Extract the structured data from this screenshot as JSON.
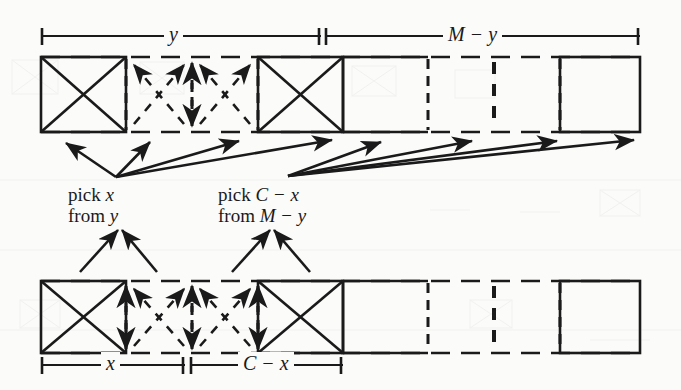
{
  "figure": {
    "background_color": "#fbfbfa",
    "ink_color": "#1a1a1a",
    "width": 681,
    "height": 390
  },
  "top_row": {
    "name": "upper-tape",
    "dimensions": [
      {
        "id": "y",
        "label": "y",
        "x_start": 41,
        "x_end": 321,
        "label_x": 172,
        "label_y": 26
      },
      {
        "id": "M-y",
        "label": "M − y",
        "x_start": 324,
        "x_end": 640,
        "label_x": 462,
        "label_y": 26
      }
    ],
    "cells": [
      {
        "index": 0,
        "style": "solid",
        "mark": "cross-full",
        "x": 41,
        "w": 85
      },
      {
        "index": 1,
        "style": "dashed",
        "mark": "cross-dashed-arrow",
        "x": 126,
        "w": 66
      },
      {
        "index": 2,
        "style": "dashed",
        "mark": "cross-dashed-arrow",
        "x": 192,
        "w": 66
      },
      {
        "index": 3,
        "style": "solid",
        "mark": "cross-full",
        "x": 258,
        "w": 85
      },
      {
        "index": 4,
        "style": "solid",
        "mark": "empty",
        "x": 343,
        "w": 85
      },
      {
        "index": 5,
        "style": "dashed",
        "mark": "empty",
        "x": 428,
        "w": 66
      },
      {
        "index": 6,
        "style": "dashed",
        "mark": "empty",
        "x": 494,
        "w": 66
      },
      {
        "index": 7,
        "style": "solid",
        "mark": "empty",
        "x": 560,
        "w": 80
      }
    ],
    "y_top": 57,
    "y_bottom": 132
  },
  "bottom_row": {
    "name": "lower-tape",
    "dimensions": [
      {
        "id": "x",
        "label": "x",
        "x_start": 41,
        "x_end": 185,
        "label_x": 108,
        "label_y": 355
      },
      {
        "id": "C-x",
        "label": "C − x",
        "x_start": 189,
        "x_end": 343,
        "label_x": 260,
        "label_y": 355
      }
    ],
    "cells": [
      {
        "index": 0,
        "style": "solid",
        "mark": "cross-full",
        "x": 41,
        "w": 85
      },
      {
        "index": 1,
        "style": "dashed",
        "mark": "cross-dashed-arrow",
        "x": 126,
        "w": 66
      },
      {
        "index": 2,
        "style": "dashed",
        "mark": "cross-dashed-arrow",
        "x": 192,
        "w": 66
      },
      {
        "index": 3,
        "style": "solid",
        "mark": "cross-full",
        "x": 258,
        "w": 85
      },
      {
        "index": 4,
        "style": "solid",
        "mark": "empty",
        "x": 343,
        "w": 85
      },
      {
        "index": 5,
        "style": "dashed",
        "mark": "empty",
        "x": 428,
        "w": 66
      },
      {
        "index": 6,
        "style": "dashed",
        "mark": "empty",
        "x": 494,
        "w": 66
      },
      {
        "index": 7,
        "style": "solid",
        "mark": "empty",
        "x": 560,
        "w": 80
      }
    ],
    "y_top": 281,
    "y_bottom": 353
  },
  "annotations": {
    "pick_left": {
      "line1_prefix": "pick ",
      "line1_var": "x",
      "line2_prefix": "from ",
      "line2_var": "y",
      "x": 68,
      "y": 188
    },
    "pick_right": {
      "line1_prefix": "pick ",
      "line1_var": "C",
      "line1_op": " − ",
      "line1_var2": "x",
      "line2_prefix": "from ",
      "line2_var": "M",
      "line2_op": " − ",
      "line2_var2": "y",
      "x": 218,
      "y": 188
    }
  },
  "arrows": {
    "fan_left": {
      "name": "fan-from-pick-x",
      "origin": {
        "x": 116,
        "y": 177
      },
      "targets": [
        {
          "x": 64,
          "y": 142
        },
        {
          "x": 148,
          "y": 141
        },
        {
          "x": 237,
          "y": 140
        },
        {
          "x": 330,
          "y": 139
        }
      ]
    },
    "fan_right": {
      "name": "fan-from-pick-C-minus-x",
      "origin": {
        "x": 288,
        "y": 176
      },
      "targets": [
        {
          "x": 379,
          "y": 141
        },
        {
          "x": 470,
          "y": 140
        },
        {
          "x": 555,
          "y": 140
        },
        {
          "x": 632,
          "y": 139
        }
      ]
    },
    "up_left": {
      "name": "arrows-up-to-lower-tape-left",
      "apex": {
        "x": 120,
        "y": 228
      },
      "bases": [
        {
          "x": 80,
          "y": 272
        },
        {
          "x": 157,
          "y": 272
        }
      ]
    },
    "up_right": {
      "name": "arrows-up-to-lower-tape-right",
      "apex": {
        "x": 272,
        "y": 228
      },
      "bases": [
        {
          "x": 232,
          "y": 272
        },
        {
          "x": 310,
          "y": 272
        }
      ]
    }
  }
}
